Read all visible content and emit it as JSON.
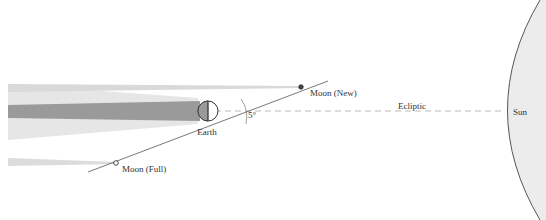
{
  "diagram": {
    "labels": {
      "moon_new": "Moon (New)",
      "moon_full": "Moon (Full)",
      "earth": "Earth",
      "ecliptic": "Ecliptic",
      "sun": "Sun",
      "angle": "5°"
    },
    "colors": {
      "umbra": "#9a9a9a",
      "penumbra": "#e6e6e6",
      "sun_fill": "#ececec",
      "line": "#555555",
      "ecliptic_dash": "#bbbbbb"
    }
  }
}
